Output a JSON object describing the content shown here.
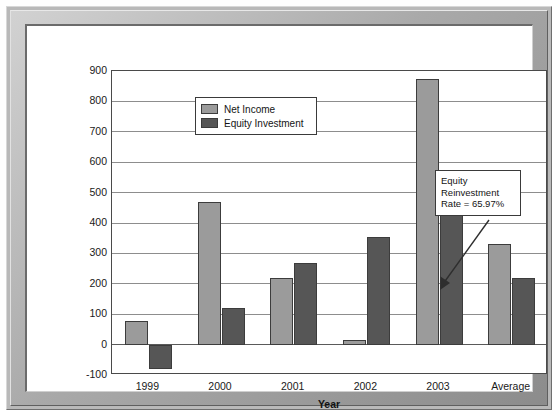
{
  "chart_data": {
    "type": "bar",
    "title": "",
    "xlabel": "Year",
    "ylabel": "",
    "categories": [
      "1999",
      "2000",
      "2001",
      "2002",
      "2003",
      "Average"
    ],
    "series": [
      {
        "name": "Net Income",
        "color": "#9b9b9b",
        "values": [
          78,
          468,
          218,
          15,
          875,
          332
        ]
      },
      {
        "name": "Equity Investment",
        "color": "#565656",
        "values": [
          -80,
          120,
          270,
          353,
          445,
          219
        ]
      }
    ],
    "ylim": [
      -100,
      900
    ],
    "ytick_step": 100,
    "yticks": [
      "900",
      "800",
      "700",
      "600",
      "500",
      "400",
      "300",
      "200",
      "100",
      "0",
      "-100"
    ],
    "grid": true,
    "legend_position": "top-center",
    "annotations": [
      {
        "name": "equity-reinvestment-rate",
        "lines": [
          "Equity",
          "Reinvestment",
          "Rate = 65.97%"
        ],
        "points_to": "Average / Equity Investment bar"
      }
    ]
  },
  "legend": {
    "items": [
      {
        "label": "Net Income"
      },
      {
        "label": "Equity Investment"
      }
    ]
  },
  "axis": {
    "x_title": "Year"
  }
}
